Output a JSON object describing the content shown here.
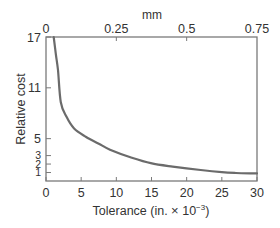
{
  "chart_data": {
    "type": "line",
    "title": "",
    "xlabel": "Tolerance (in. × 10⁻³)",
    "xlabel_main": "Tolerance (in. ",
    "xlabel_times": "×",
    "xlabel_base": " 10",
    "xlabel_exp": "−3",
    "xlabel_close": ")",
    "ylabel": "Relative cost",
    "x2label": "mm",
    "xlim": [
      0,
      30
    ],
    "ylim": [
      0,
      17
    ],
    "x2lim": [
      0,
      0.75
    ],
    "x_ticks": [
      0,
      5,
      10,
      15,
      20,
      25,
      30
    ],
    "x_tick_labels": [
      "0",
      "5",
      "10",
      "15",
      "20",
      "25",
      "30"
    ],
    "y_ticks": [
      1,
      2,
      3,
      5,
      11,
      17
    ],
    "y_tick_labels": [
      "1",
      "2",
      "3",
      "5",
      "11",
      "17"
    ],
    "x2_ticks": [
      0,
      0.25,
      0.5,
      0.75
    ],
    "x2_tick_labels": [
      "0",
      "0.25",
      "0.5",
      "0.75"
    ],
    "grid": false,
    "legend": null,
    "series": [
      {
        "name": "Relative cost",
        "x": [
          1.1,
          1.4,
          1.7,
          2.1,
          2.9,
          4.0,
          5.7,
          7.5,
          9.1,
          12.0,
          14.9,
          18.0,
          22.0,
          25.0,
          27.0,
          30.0
        ],
        "y": [
          17.0,
          15.0,
          13.1,
          9.3,
          7.6,
          6.2,
          5.2,
          4.4,
          3.7,
          2.8,
          2.1,
          1.7,
          1.3,
          1.05,
          0.95,
          0.9
        ]
      }
    ],
    "colors": {
      "line": "#6b6b6b",
      "frame": "#7a7a7a",
      "text": "#333333"
    }
  }
}
